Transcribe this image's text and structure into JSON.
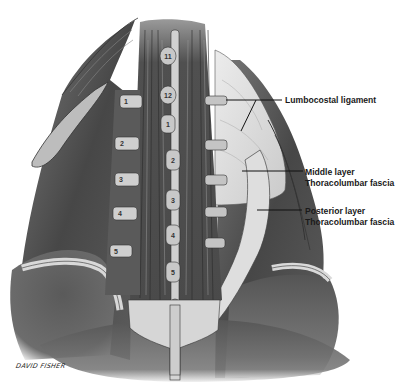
{
  "figure": {
    "style": "grayscale pencil illustration",
    "artist_signature": "DAVID FISHER"
  },
  "labels": [
    {
      "id": "lumbocostal",
      "text": "Lumbocostal ligament"
    },
    {
      "id": "middle",
      "line1": "Middle layer",
      "line2": "Thoracolumbar fascia"
    },
    {
      "id": "posterior",
      "line1": "Posterior layer",
      "line2": "Thoracolumbar fascia"
    }
  ],
  "vertebrae": {
    "thoracic": [
      "11",
      "12"
    ],
    "lumbar_spinous": [
      "1",
      "2",
      "3",
      "4",
      "5"
    ],
    "left_transverse": [
      "1",
      "2",
      "3",
      "4",
      "5"
    ]
  },
  "colors": {
    "muscle_dark": "#4a4a4a",
    "muscle_mid": "#6e6e6e",
    "fascia_light": "#d9d9d9",
    "bone": "#cfcfcf",
    "text": "#1a1a1a"
  }
}
